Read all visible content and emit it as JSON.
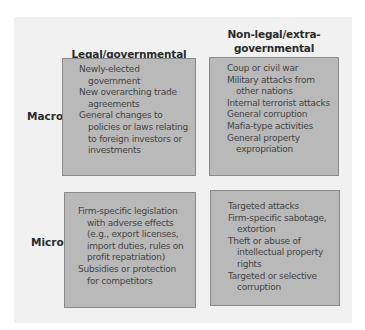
{
  "columns": [
    {
      "label": "Legal/governmental"
    },
    {
      "label": "Non-legal/extra-governmental",
      "lines": [
        "Non-legal/extra-",
        "governmental"
      ]
    }
  ],
  "rows": [
    {
      "label": "Macro"
    },
    {
      "label": "Micro"
    }
  ],
  "cells": {
    "macro_legal": [
      "Newly-elected government",
      "New overarching trade agreements",
      "General changes to policies or laws relating to foreign investors or investments"
    ],
    "macro_nonlegal": [
      "Coup or civil war",
      "Military attacks from other nations",
      "Internal terrorist attacks",
      "General corruption",
      "Mafia-type activities",
      "General property expropriation"
    ],
    "micro_legal": [
      "Firm-specific legislation with adverse effects (e.g., export licenses, import duties, rules on profit repatriation)",
      "Subsidies or protection for competitors"
    ],
    "micro_nonlegal": [
      "Targeted attacks",
      "Firm-specific sabotage, extortion",
      "Theft or abuse of intellectual property rights",
      "Targeted or selective corruption"
    ]
  },
  "colors": {
    "panel": "#f1f1f1",
    "box_fill": "#b9b9b9",
    "box_border": "#8a8a8a",
    "text": "#454545",
    "heading": "#2b2b2b"
  }
}
